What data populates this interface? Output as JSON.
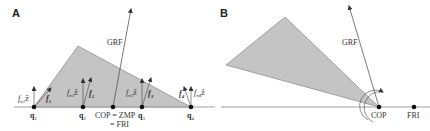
{
  "panels": [
    {
      "id": "A",
      "label": "A",
      "grf_label": "GRF",
      "points": [
        {
          "name": "q1",
          "label": "q",
          "sub": "1"
        },
        {
          "name": "q2",
          "label": "q",
          "sub": "2"
        },
        {
          "name": "q3",
          "label": "q",
          "sub": "3"
        },
        {
          "name": "q4",
          "label": "q",
          "sub": "4"
        }
      ],
      "cop_label_line1": "COP = ZMP",
      "cop_label_line2": "= FRI",
      "forces": [
        {
          "name": "f1",
          "label": "f",
          "sub": "1"
        },
        {
          "name": "f2",
          "label": "f",
          "sub": "2"
        },
        {
          "name": "f3",
          "label": "f",
          "sub": "3"
        },
        {
          "name": "f4",
          "label": "f",
          "sub": "4"
        }
      ],
      "normal_forces": [
        {
          "name": "fn1",
          "label": "f",
          "sub": "n1",
          "suffix": "ẑ"
        },
        {
          "name": "fn2",
          "label": "f",
          "sub": "n2",
          "suffix": "ẑ"
        },
        {
          "name": "fn3",
          "label": "f",
          "sub": "n3",
          "suffix": "ẑ"
        },
        {
          "name": "fn4",
          "label": "f",
          "sub": "n4",
          "suffix": "ẑ"
        }
      ]
    },
    {
      "id": "B",
      "label": "B",
      "grf_label": "GRF",
      "cop_label": "COP",
      "fri_label": "FRI"
    }
  ],
  "colors": {
    "fill": "#c4c4c4",
    "line": "#555555",
    "dot": "#111111",
    "ground": "#888888"
  }
}
